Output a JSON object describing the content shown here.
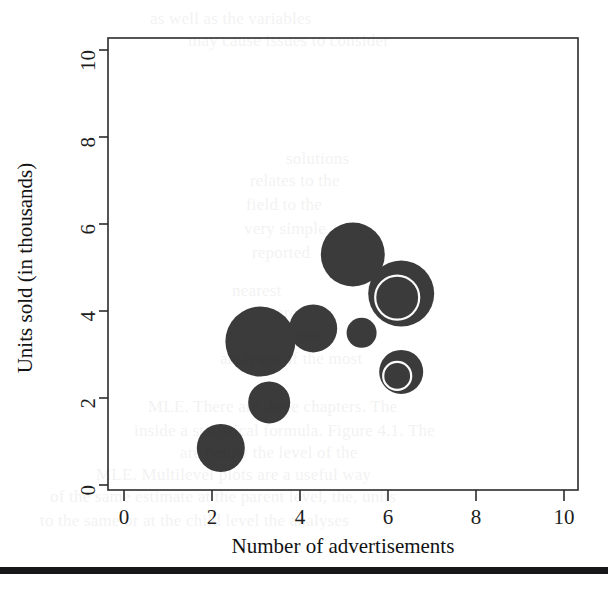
{
  "figure": {
    "background_color": "#ffffff",
    "plot_frame_color": "#2b2b2b",
    "bubble_color": "#3b3b3b",
    "ring_color": "#fbfbfb"
  },
  "axes": {
    "x_title": "Number of advertisements",
    "y_title": "Units sold (in thousands)",
    "x_ticks": [
      "0",
      "2",
      "4",
      "6",
      "8",
      "10"
    ],
    "y_ticks": [
      "0",
      "2",
      "4",
      "6",
      "8",
      "10"
    ]
  },
  "page_artifacts": {
    "bottom_bar_label": "scanned-page-edge-bar",
    "ghost_text": [
      {
        "text": "as well as the variables",
        "x": 150,
        "y": 6
      },
      {
        "text": "may cause issues to consider",
        "x": 188,
        "y": 28
      },
      {
        "text": "solutions",
        "x": 286,
        "y": 146
      },
      {
        "text": "relates to the",
        "x": 250,
        "y": 168
      },
      {
        "text": "field to the",
        "x": 246,
        "y": 192
      },
      {
        "text": "very simple",
        "x": 244,
        "y": 216
      },
      {
        "text": "reported",
        "x": 252,
        "y": 240
      },
      {
        "text": "nearest",
        "x": 232,
        "y": 278
      },
      {
        "text": "are",
        "x": 276,
        "y": 300
      },
      {
        "text": "can",
        "x": 296,
        "y": 322
      },
      {
        "text": "analyses of the most",
        "x": 220,
        "y": 346
      },
      {
        "text": "MLE. There are three chapters. The",
        "x": 148,
        "y": 394
      },
      {
        "text": "inside a statistical formula. Figure 4.1. The",
        "x": 134,
        "y": 418
      },
      {
        "text": "are below the level of the",
        "x": 180,
        "y": 440
      },
      {
        "text": "MLE. Multilevel plots are a useful way",
        "x": 96,
        "y": 462
      },
      {
        "text": "of the same estimate at the parent level, the, units",
        "x": 50,
        "y": 484
      },
      {
        "text": "to the same or at the child level the analyses",
        "x": 40,
        "y": 508
      }
    ]
  },
  "chart_data": {
    "type": "scatter",
    "title": "",
    "xlabel": "Number of advertisements",
    "ylabel": "Units sold (in thousands)",
    "xlim": [
      -0.35,
      10.3
    ],
    "ylim": [
      -0.8,
      10.1
    ],
    "grid": false,
    "legend": "none",
    "size_encoding": "bubble-radius",
    "points": [
      {
        "id": "b1",
        "x": 5.2,
        "y": 5.3,
        "r_px": 32,
        "ring": false
      },
      {
        "id": "b2",
        "x": 6.3,
        "y": 4.4,
        "r_px": 33,
        "ring": true,
        "ring_r_px": 22
      },
      {
        "id": "b3",
        "x": 3.1,
        "y": 3.3,
        "r_px": 35,
        "ring": false
      },
      {
        "id": "b4",
        "x": 4.3,
        "y": 3.6,
        "r_px": 24,
        "ring": false
      },
      {
        "id": "b5",
        "x": 5.4,
        "y": 3.5,
        "r_px": 15,
        "ring": false
      },
      {
        "id": "b6",
        "x": 6.3,
        "y": 2.6,
        "r_px": 22,
        "ring": true,
        "ring_r_px": 14
      },
      {
        "id": "b7",
        "x": 3.3,
        "y": 1.9,
        "r_px": 21,
        "ring": false
      },
      {
        "id": "b8",
        "x": 2.2,
        "y": 0.85,
        "r_px": 24,
        "ring": false
      }
    ]
  }
}
